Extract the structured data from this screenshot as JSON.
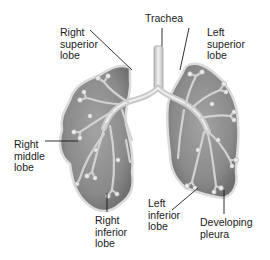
{
  "diagram": {
    "colors": {
      "lung_fill": "#8c8c8c",
      "lung_edge": "#d9d9d9",
      "airway": "#c8c8c8",
      "airway_highlight": "#ececec",
      "leader_line": "#1a1a1a",
      "text": "#1a1a1a"
    },
    "labels": {
      "trachea": "Trachea",
      "right_superior_lobe": "Right\nsuperior\nlobe",
      "left_superior_lobe": "Left\nsuperior\nlobe",
      "right_middle_lobe": "Right\nmiddle\nlobe",
      "right_inferior_lobe": "Right\ninferior\nlobe",
      "left_inferior_lobe": "Left\ninferior\nlobe",
      "developing_pleura": "Developing\npleura"
    }
  }
}
